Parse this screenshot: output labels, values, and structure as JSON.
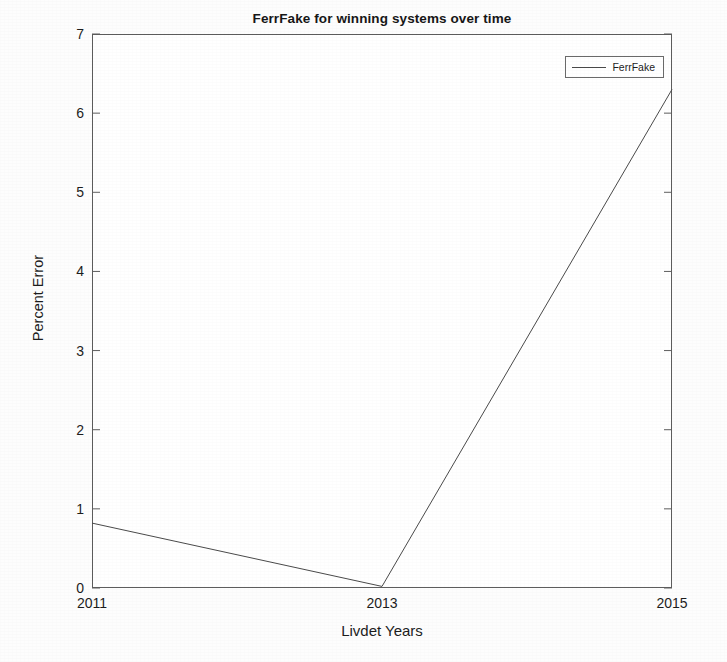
{
  "chart_data": {
    "type": "line",
    "title": "FerrFake for winning systems over time",
    "xlabel": "Livdet Years",
    "ylabel": "Percent Error",
    "x": [
      2011,
      2013,
      2015
    ],
    "xtick_labels": [
      "2011",
      "2013",
      "2015"
    ],
    "ytick_labels": [
      "0",
      "1",
      "2",
      "3",
      "4",
      "5",
      "6",
      "7"
    ],
    "xlim": [
      2011,
      2015
    ],
    "ylim": [
      0,
      7
    ],
    "grid": false,
    "legend_position": "top-right",
    "series": [
      {
        "name": "FerrFake",
        "values": [
          0.82,
          0.02,
          6.3
        ],
        "color": "#4a4a4a"
      }
    ]
  },
  "legend": {
    "entries": [
      {
        "label": "FerrFake"
      }
    ]
  }
}
